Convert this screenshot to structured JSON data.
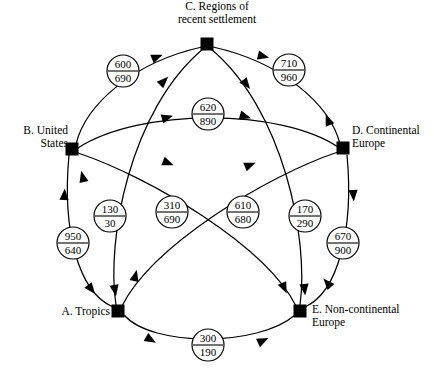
{
  "diagram": {
    "type": "directed-graph",
    "title": "",
    "nodes": [
      {
        "id": "A",
        "label": "A. Tropics",
        "x": 118,
        "y": 311
      },
      {
        "id": "B",
        "label": "B. United\nStates",
        "x": 72,
        "y": 149
      },
      {
        "id": "C",
        "label": "C. Regions of\nrecent settlement",
        "x": 207,
        "y": 44
      },
      {
        "id": "D",
        "label": "D. Continental\nEurope",
        "x": 343,
        "y": 148
      },
      {
        "id": "E",
        "label": "E. Non-continental\nEurope",
        "x": 300,
        "y": 311
      }
    ],
    "badges": [
      {
        "id": "bc",
        "top": "600",
        "bottom": "690",
        "x": 123,
        "y": 71,
        "pair": "B-C"
      },
      {
        "id": "cd",
        "top": "710",
        "bottom": "960",
        "x": 289,
        "y": 70,
        "pair": "C-D"
      },
      {
        "id": "bd",
        "top": "620",
        "bottom": "890",
        "x": 208,
        "y": 114,
        "pair": "B-D"
      },
      {
        "id": "ab",
        "top": "950",
        "bottom": "640",
        "x": 73,
        "y": 243,
        "pair": "A-B"
      },
      {
        "id": "ac",
        "top": "130",
        "bottom": "30",
        "x": 110,
        "y": 216,
        "pair": "A-C"
      },
      {
        "id": "ad",
        "top": "310",
        "bottom": "690",
        "x": 172,
        "y": 212,
        "pair": "A-D"
      },
      {
        "id": "be",
        "top": "610",
        "bottom": "680",
        "x": 243,
        "y": 212,
        "pair": "B-E"
      },
      {
        "id": "ce",
        "top": "170",
        "bottom": "290",
        "x": 305,
        "y": 216,
        "pair": "C-E"
      },
      {
        "id": "de",
        "top": "670",
        "bottom": "900",
        "x": 343,
        "y": 243,
        "pair": "D-E"
      },
      {
        "id": "ae",
        "top": "300",
        "bottom": "190",
        "x": 208,
        "y": 345,
        "pair": "A-E"
      }
    ],
    "edges": [
      {
        "from": "B",
        "to": "C",
        "badge": "bc"
      },
      {
        "from": "C",
        "to": "B",
        "badge": "bc"
      },
      {
        "from": "C",
        "to": "D",
        "badge": "cd"
      },
      {
        "from": "D",
        "to": "C",
        "badge": "cd"
      },
      {
        "from": "B",
        "to": "D",
        "badge": "bd"
      },
      {
        "from": "D",
        "to": "B",
        "badge": "bd"
      },
      {
        "from": "A",
        "to": "B",
        "badge": "ab"
      },
      {
        "from": "B",
        "to": "A",
        "badge": "ab"
      },
      {
        "from": "A",
        "to": "C",
        "badge": "ac"
      },
      {
        "from": "C",
        "to": "A",
        "badge": "ac"
      },
      {
        "from": "A",
        "to": "D",
        "badge": "ad"
      },
      {
        "from": "D",
        "to": "A",
        "badge": "ad"
      },
      {
        "from": "B",
        "to": "E",
        "badge": "be"
      },
      {
        "from": "E",
        "to": "B",
        "badge": "be"
      },
      {
        "from": "C",
        "to": "E",
        "badge": "ce"
      },
      {
        "from": "E",
        "to": "C",
        "badge": "ce"
      },
      {
        "from": "D",
        "to": "E",
        "badge": "de"
      },
      {
        "from": "E",
        "to": "D",
        "badge": "de"
      },
      {
        "from": "A",
        "to": "E",
        "badge": "ae"
      },
      {
        "from": "E",
        "to": "A",
        "badge": "ae"
      }
    ],
    "colors": {
      "stroke": "#000000",
      "fill": "#ffffff",
      "node": "#000000"
    }
  }
}
